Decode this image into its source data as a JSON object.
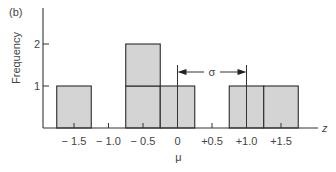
{
  "panel_label": "(b)",
  "chart_data": {
    "type": "bar",
    "title": "",
    "panel": "(b)",
    "xlabel": "z",
    "ylabel": "Frequency",
    "x_ticks": [
      "-1.5",
      "-1.0",
      "-0.5",
      "0",
      "+0.5",
      "+1.0",
      "+1.5"
    ],
    "x_tick_values": [
      -1.5,
      -1.0,
      -0.5,
      0,
      0.5,
      1.0,
      1.5
    ],
    "y_ticks": [
      "1",
      "2"
    ],
    "y_tick_values": [
      1,
      2
    ],
    "bin_width": 0.5,
    "bars": [
      {
        "center": -1.5,
        "frequency": 1
      },
      {
        "center": -0.5,
        "frequency": 2
      },
      {
        "center": 0.0,
        "frequency": 1
      },
      {
        "center": 1.0,
        "frequency": 1
      },
      {
        "center": 1.5,
        "frequency": 1
      }
    ],
    "categories": [
      "-1.5",
      "-0.5",
      "0",
      "+1.0",
      "+1.5"
    ],
    "values": [
      1,
      2,
      1,
      1,
      1
    ],
    "annotations": [
      {
        "type": "mean-marker",
        "label": "μ",
        "x": 0
      },
      {
        "type": "span-arrow",
        "label": "σ",
        "from": 0,
        "to": 1.0
      }
    ],
    "xlim": [
      -1.95,
      2.0
    ],
    "ylim": [
      0,
      2.8
    ],
    "grid": false,
    "legend": null,
    "bar_fill": "#d4d4d4",
    "bar_edge": "#2a2a2a"
  }
}
